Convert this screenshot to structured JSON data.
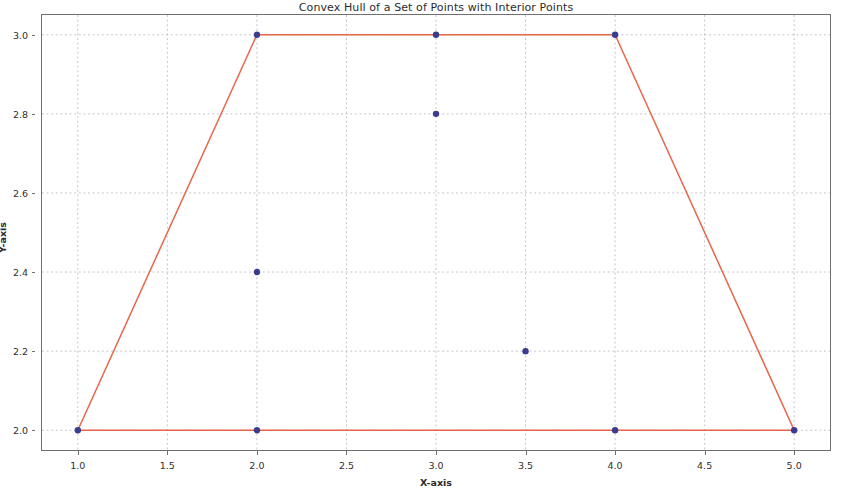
{
  "chart_data": {
    "type": "scatter",
    "title": "Convex Hull of a Set of Points with Interior Points",
    "xlabel": "X-axis",
    "ylabel": "Y-axis",
    "xlim": [
      0.8,
      5.2
    ],
    "ylim": [
      1.95,
      3.05
    ],
    "grid": true,
    "legend": null,
    "xticks": [
      "1.0",
      "1.5",
      "2.0",
      "2.5",
      "3.0",
      "3.5",
      "4.0",
      "4.5",
      "5.0"
    ],
    "xtick_values": [
      1.0,
      1.5,
      2.0,
      2.5,
      3.0,
      3.5,
      4.0,
      4.5,
      5.0
    ],
    "yticks": [
      "2.0",
      "2.2",
      "2.4",
      "2.6",
      "2.8",
      "3.0"
    ],
    "ytick_values": [
      2.0,
      2.2,
      2.4,
      2.6,
      2.8,
      3.0
    ],
    "series": [
      {
        "name": "points",
        "type": "scatter",
        "marker": "circle",
        "color": "#3b3b8f",
        "x": [
          1.0,
          2.0,
          2.0,
          2.0,
          3.0,
          3.0,
          3.5,
          4.0,
          4.0,
          5.0
        ],
        "y": [
          2.0,
          2.0,
          2.4,
          3.0,
          2.8,
          3.0,
          2.2,
          2.0,
          3.0,
          2.0
        ],
        "points": [
          {
            "x": 1.0,
            "y": 2.0,
            "role": "hull-vertex"
          },
          {
            "x": 2.0,
            "y": 2.0,
            "role": "on-hull-edge"
          },
          {
            "x": 2.0,
            "y": 2.4,
            "role": "interior"
          },
          {
            "x": 2.0,
            "y": 3.0,
            "role": "hull-vertex"
          },
          {
            "x": 3.0,
            "y": 2.8,
            "role": "interior"
          },
          {
            "x": 3.0,
            "y": 3.0,
            "role": "on-hull-edge"
          },
          {
            "x": 3.5,
            "y": 2.2,
            "role": "interior"
          },
          {
            "x": 4.0,
            "y": 2.0,
            "role": "on-hull-edge"
          },
          {
            "x": 4.0,
            "y": 3.0,
            "role": "hull-vertex"
          },
          {
            "x": 5.0,
            "y": 2.0,
            "role": "hull-vertex"
          }
        ]
      },
      {
        "name": "convex hull",
        "type": "line",
        "color": "#e8654a",
        "closed": true,
        "x": [
          1.0,
          2.0,
          4.0,
          5.0,
          1.0
        ],
        "y": [
          2.0,
          3.0,
          3.0,
          2.0,
          2.0
        ]
      }
    ]
  }
}
